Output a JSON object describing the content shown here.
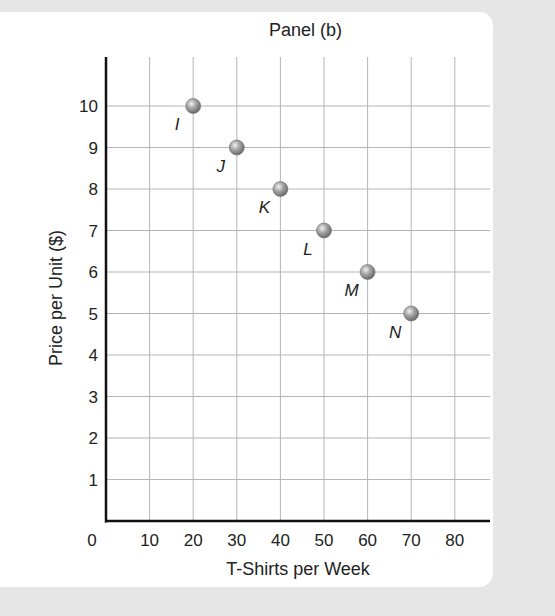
{
  "chart_data": {
    "type": "scatter",
    "title": "Panel (b)",
    "xlabel": "T-Shirts per Week",
    "ylabel": "Price per Unit ($)",
    "xlim": [
      0,
      88
    ],
    "ylim": [
      0,
      11
    ],
    "grid": true,
    "x_ticks": [
      0,
      10,
      20,
      30,
      40,
      50,
      60,
      70,
      80
    ],
    "y_ticks": [
      0,
      1,
      2,
      3,
      4,
      5,
      6,
      7,
      8,
      9,
      10
    ],
    "points": [
      {
        "label": "I",
        "x": 20,
        "y": 10
      },
      {
        "label": "J",
        "x": 30,
        "y": 9
      },
      {
        "label": "K",
        "x": 40,
        "y": 8
      },
      {
        "label": "L",
        "x": 50,
        "y": 7
      },
      {
        "label": "M",
        "x": 60,
        "y": 6
      },
      {
        "label": "N",
        "x": 70,
        "y": 5
      }
    ],
    "colors": {
      "point": "#9a9a9a",
      "grid": "#b5b5b5",
      "axis": "#111111"
    }
  }
}
